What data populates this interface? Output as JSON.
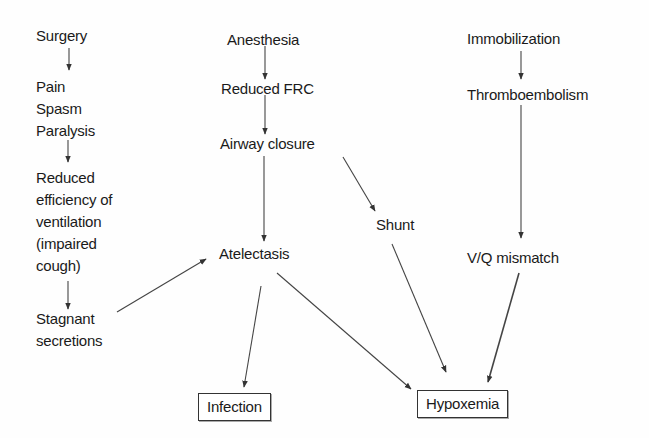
{
  "diagram": {
    "nodes": {
      "surgery": "Surgery",
      "pain": "Pain",
      "spasm": "Spasm",
      "paralysis": "Paralysis",
      "reduced_eff_1": "Reduced",
      "reduced_eff_2": "efficiency of",
      "reduced_eff_3": "ventilation",
      "reduced_eff_4": "(impaired",
      "reduced_eff_5": "cough)",
      "stagnant_1": "Stagnant",
      "stagnant_2": "secretions",
      "anesthesia": "Anesthesia",
      "reduced_frc": "Reduced FRC",
      "airway_closure": "Airway closure",
      "atelectasis": "Atelectasis",
      "shunt": "Shunt",
      "immobilization": "Immobilization",
      "thromboembolism": "Thromboembolism",
      "vq_mismatch": "V/Q mismatch",
      "infection": "Infection",
      "hypoxemia": "Hypoxemia"
    },
    "edges": [
      {
        "from": "Surgery",
        "to": "Pain/Spasm/Paralysis"
      },
      {
        "from": "Pain/Spasm/Paralysis",
        "to": "Reduced efficiency of ventilation (impaired cough)"
      },
      {
        "from": "Reduced efficiency of ventilation (impaired cough)",
        "to": "Stagnant secretions"
      },
      {
        "from": "Stagnant secretions",
        "to": "Atelectasis"
      },
      {
        "from": "Anesthesia",
        "to": "Reduced FRC"
      },
      {
        "from": "Reduced FRC",
        "to": "Airway closure"
      },
      {
        "from": "Airway closure",
        "to": "Atelectasis"
      },
      {
        "from": "Airway closure",
        "to": "Shunt"
      },
      {
        "from": "Immobilization",
        "to": "Thromboembolism"
      },
      {
        "from": "Thromboembolism",
        "to": "V/Q mismatch"
      },
      {
        "from": "Atelectasis",
        "to": "Infection"
      },
      {
        "from": "Atelectasis",
        "to": "Hypoxemia"
      },
      {
        "from": "Shunt",
        "to": "Hypoxemia"
      },
      {
        "from": "V/Q mismatch",
        "to": "Hypoxemia"
      }
    ],
    "colors": {
      "text": "#1a1a1a",
      "line": "#333333",
      "background": "#fefefe"
    }
  }
}
